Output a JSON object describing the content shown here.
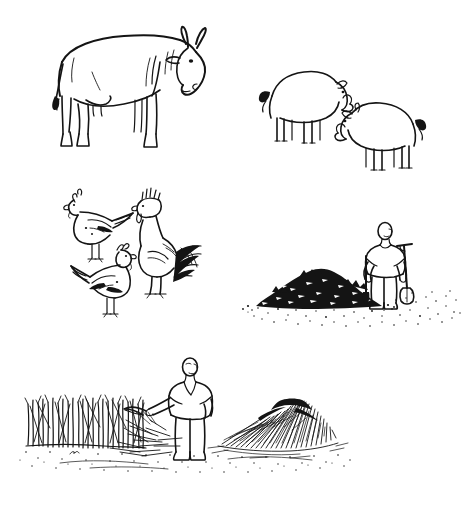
{
  "page": {
    "background_color": "#ffffff",
    "ink_color": "#141414",
    "width": 469,
    "height": 506,
    "medium": "pen and ink line drawing"
  },
  "scenes": [
    {
      "id": "livestock-row",
      "label": "Livestock row",
      "items": [
        {
          "id": "cow",
          "label": "Cow",
          "facing": "right",
          "count": 1
        },
        {
          "id": "pig-upper",
          "label": "Pig facing right",
          "facing": "right",
          "count": 1
        },
        {
          "id": "pig-lower",
          "label": "Pig facing left",
          "facing": "left",
          "count": 1
        }
      ]
    },
    {
      "id": "poultry-group",
      "label": "Poultry group",
      "items": [
        {
          "id": "hen-upper",
          "label": "Hen facing left",
          "facing": "left",
          "count": 1
        },
        {
          "id": "rooster",
          "label": "Rooster",
          "facing": "left",
          "count": 1
        },
        {
          "id": "hen-lower",
          "label": "Hen facing right",
          "facing": "right",
          "count": 1
        }
      ]
    },
    {
      "id": "compost-scene",
      "label": "Farmer with spade beside compost heap",
      "items": [
        {
          "id": "compost-heap",
          "label": "Compost heap",
          "count": 1
        },
        {
          "id": "farmer-with-spade",
          "label": "Farmer holding spade",
          "count": 1
        },
        {
          "id": "ground-stipple",
          "label": "Stippled ground",
          "count": 1
        }
      ]
    },
    {
      "id": "harvest-scene",
      "label": "Farmer cutting standing crop beside cut pile",
      "items": [
        {
          "id": "standing-crop",
          "label": "Standing crop stalks",
          "count": 1
        },
        {
          "id": "farmer-with-sickle",
          "label": "Farmer holding sickle",
          "count": 1
        },
        {
          "id": "cut-stalk-pile",
          "label": "Pile of cut stalks",
          "count": 1
        },
        {
          "id": "ground-stipple",
          "label": "Stippled ground",
          "count": 1
        }
      ]
    }
  ],
  "alt_text": "Black ink line drawing on white: a cow and two pigs along the top, three chickens including a rooster at middle left, a person with a spade beside a dark compost heap at middle right, and a person with a sickle cutting a standing crop beside a pile of cut stalks along the bottom."
}
